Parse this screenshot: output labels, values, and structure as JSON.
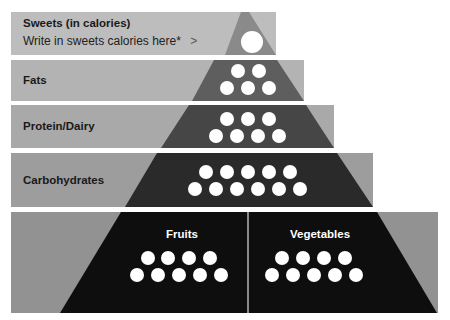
{
  "diagram": {
    "type": "food-pyramid",
    "colors": {
      "background": "#ffffff",
      "band_sweets": "#bdbdbd",
      "band_fats": "#b3b3b3",
      "band_protein": "#a9a9a9",
      "band_carbs": "#9d9d9d",
      "band_base": "#929292",
      "tri_sweets": "#8a8a8a",
      "tri_fats": "#5e5e5e",
      "tri_protein": "#464646",
      "tri_carbs": "#2a2a2a",
      "tri_base": "#0e0e0e",
      "dot": "#ffffff"
    },
    "levels": [
      {
        "name": "sweets",
        "label": "Sweets (in calories)",
        "sublabel": "Write in sweets calories here*",
        "chevron": ">",
        "dots": 1
      },
      {
        "name": "fats",
        "label": "Fats",
        "dots": 5
      },
      {
        "name": "protein",
        "label": "Protein/Dairy",
        "dots": 7
      },
      {
        "name": "carbs",
        "label": "Carbohydrates",
        "dots": 11
      },
      {
        "name": "base",
        "sections": [
          {
            "label": "Fruits",
            "dots": 9
          },
          {
            "label": "Vegetables",
            "dots": 9
          }
        ]
      }
    ]
  }
}
